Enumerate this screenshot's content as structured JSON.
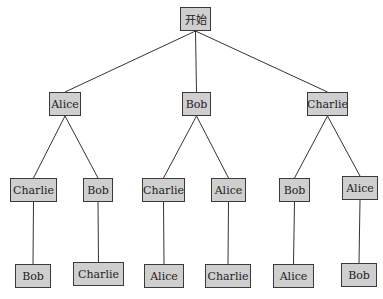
{
  "diagram": {
    "type": "tree",
    "title": "",
    "root": {
      "id": "n0",
      "label": "开始"
    },
    "nodes": [
      {
        "id": "n0",
        "label": "开始",
        "x": 180,
        "y": 7,
        "w": 31
      },
      {
        "id": "n1",
        "label": "Alice",
        "x": 49,
        "y": 92,
        "w": 32
      },
      {
        "id": "n2",
        "label": "Bob",
        "x": 182,
        "y": 92,
        "w": 29
      },
      {
        "id": "n3",
        "label": "Charlie",
        "x": 307,
        "y": 92,
        "w": 41
      },
      {
        "id": "n4",
        "label": "Charlie",
        "x": 10,
        "y": 178,
        "w": 47
      },
      {
        "id": "n5",
        "label": "Bob",
        "x": 83,
        "y": 178,
        "w": 30
      },
      {
        "id": "n6",
        "label": "Charlie",
        "x": 142,
        "y": 178,
        "w": 43
      },
      {
        "id": "n7",
        "label": "Alice",
        "x": 211,
        "y": 178,
        "w": 35
      },
      {
        "id": "n8",
        "label": "Bob",
        "x": 279,
        "y": 178,
        "w": 31
      },
      {
        "id": "n9",
        "label": "Alice",
        "x": 342,
        "y": 176,
        "w": 36
      },
      {
        "id": "n10",
        "label": "Bob",
        "x": 15,
        "y": 264,
        "w": 36
      },
      {
        "id": "n11",
        "label": "Charlie",
        "x": 73,
        "y": 262,
        "w": 51
      },
      {
        "id": "n12",
        "label": "Alice",
        "x": 144,
        "y": 264,
        "w": 40
      },
      {
        "id": "n13",
        "label": "Charlie",
        "x": 205,
        "y": 264,
        "w": 46
      },
      {
        "id": "n14",
        "label": "Alice",
        "x": 273,
        "y": 264,
        "w": 41
      },
      {
        "id": "n15",
        "label": "Bob",
        "x": 341,
        "y": 263,
        "w": 36
      }
    ],
    "edges": [
      [
        "n0",
        "n1"
      ],
      [
        "n0",
        "n2"
      ],
      [
        "n0",
        "n3"
      ],
      [
        "n1",
        "n4"
      ],
      [
        "n1",
        "n5"
      ],
      [
        "n2",
        "n6"
      ],
      [
        "n2",
        "n7"
      ],
      [
        "n3",
        "n8"
      ],
      [
        "n3",
        "n9"
      ],
      [
        "n4",
        "n10"
      ],
      [
        "n5",
        "n11"
      ],
      [
        "n6",
        "n12"
      ],
      [
        "n7",
        "n13"
      ],
      [
        "n8",
        "n14"
      ],
      [
        "n9",
        "n15"
      ]
    ],
    "colors": {
      "node_fill": "#cfcfcf",
      "node_border": "#3a3a3a",
      "edge": "#333333"
    }
  }
}
